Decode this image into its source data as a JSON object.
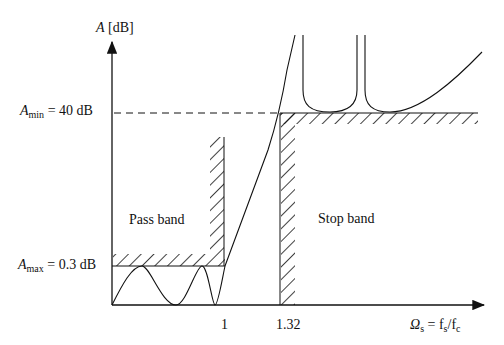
{
  "y_axis": {
    "symbol": "A",
    "unit": "[dB]"
  },
  "x_axis": {
    "symbol": "Ω",
    "sub": "s",
    "eq": " = f",
    "eq_sub1": "s",
    "slash": "/f",
    "eq_sub2": "c"
  },
  "levels": {
    "a_min": {
      "symbol": "A",
      "sub": "min",
      "value_text": " = 40 dB",
      "value_db": 40
    },
    "a_max": {
      "symbol": "A",
      "sub": "max",
      "value_text": " = 0.3 dB",
      "value_db": 0.3
    }
  },
  "ticks": {
    "passband_edge": "1",
    "stopband_edge": "1.32"
  },
  "regions": {
    "pass": "Pass band",
    "stop": "Stop band"
  }
}
